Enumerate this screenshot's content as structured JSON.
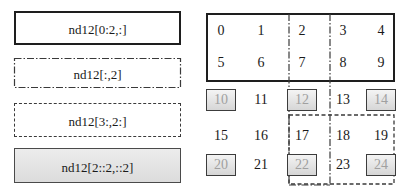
{
  "diagram": {
    "slice_labels": [
      {
        "id": "rows-0-2",
        "text": "nd12[0:2,:]",
        "style": "solid"
      },
      {
        "id": "col-2",
        "text": "nd12[:,2]",
        "style": "dash-dot"
      },
      {
        "id": "rows3-cols2",
        "text": "nd12[3:,2:]",
        "style": "dashed"
      },
      {
        "id": "step-2",
        "text": "nd12[2::2,::2]",
        "style": "shaded"
      }
    ],
    "array": {
      "name": "nd12",
      "shape": [
        5,
        5
      ],
      "rows": [
        [
          "0",
          "1",
          "2",
          "3",
          "4"
        ],
        [
          "5",
          "6",
          "7",
          "8",
          "9"
        ],
        [
          "10",
          "11",
          "12",
          "13",
          "14"
        ],
        [
          "15",
          "16",
          "17",
          "18",
          "19"
        ],
        [
          "20",
          "21",
          "22",
          "23",
          "24"
        ]
      ],
      "highlighted_cells": [
        "10",
        "12",
        "14",
        "20",
        "22",
        "24"
      ]
    }
  }
}
